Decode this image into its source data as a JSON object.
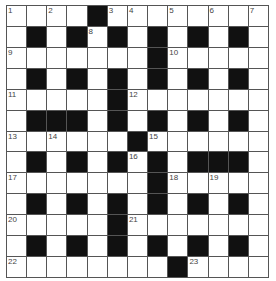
{
  "puzzle": {
    "type": "crossword",
    "rows": 13,
    "cols": 13,
    "colors": {
      "block": "#111111",
      "cell": "#ffffff",
      "border": "#555555",
      "number": "#444444"
    },
    "grid": [
      "....#........",
      ".#.#.#.#.#.#.",
      ".......#.....",
      ".#.#.#.#.#.#.",
      ".....#.......",
      ".###.#.#.#.#.",
      "......#......",
      ".#.#.#.#.###.",
      ".......#.....",
      ".#.#.#.#.#.#.",
      ".....#.......",
      ".#.#.#.#.#.#.",
      "........#...."
    ],
    "numbers": [
      {
        "r": 0,
        "c": 0,
        "n": "1"
      },
      {
        "r": 0,
        "c": 2,
        "n": "2"
      },
      {
        "r": 0,
        "c": 5,
        "n": "3"
      },
      {
        "r": 0,
        "c": 6,
        "n": "4"
      },
      {
        "r": 0,
        "c": 8,
        "n": "5"
      },
      {
        "r": 0,
        "c": 10,
        "n": "6"
      },
      {
        "r": 0,
        "c": 12,
        "n": "7"
      },
      {
        "r": 1,
        "c": 4,
        "n": "8"
      },
      {
        "r": 2,
        "c": 0,
        "n": "9"
      },
      {
        "r": 2,
        "c": 8,
        "n": "10"
      },
      {
        "r": 4,
        "c": 0,
        "n": "11"
      },
      {
        "r": 4,
        "c": 6,
        "n": "12"
      },
      {
        "r": 6,
        "c": 0,
        "n": "13"
      },
      {
        "r": 6,
        "c": 2,
        "n": "14"
      },
      {
        "r": 6,
        "c": 7,
        "n": "15"
      },
      {
        "r": 7,
        "c": 6,
        "n": "16"
      },
      {
        "r": 8,
        "c": 0,
        "n": "17"
      },
      {
        "r": 8,
        "c": 8,
        "n": "18"
      },
      {
        "r": 8,
        "c": 10,
        "n": "19"
      },
      {
        "r": 10,
        "c": 0,
        "n": "20"
      },
      {
        "r": 10,
        "c": 6,
        "n": "21"
      },
      {
        "r": 12,
        "c": 0,
        "n": "22"
      },
      {
        "r": 12,
        "c": 9,
        "n": "23"
      }
    ]
  }
}
